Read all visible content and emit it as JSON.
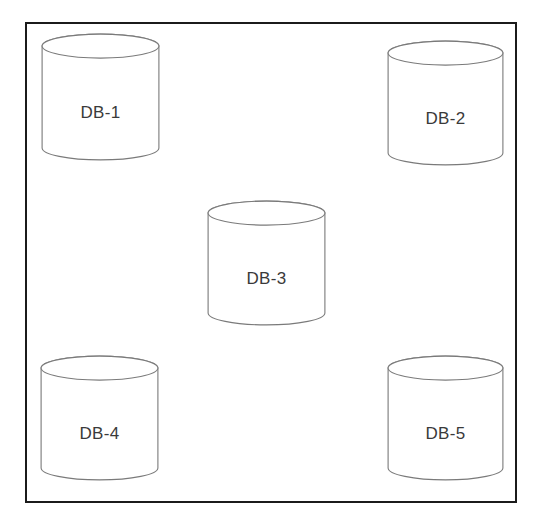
{
  "diagram": {
    "background_color": "#ffffff",
    "frame": {
      "name": "outer-boundary",
      "border_color": "#1b1b1b",
      "border_width": 2.5,
      "x": 25,
      "y": 22,
      "width": 492,
      "height": 481
    },
    "shape_style": {
      "type": "cylinder",
      "stroke_color": "#7a7a7a",
      "stroke_width": 1.1,
      "fill_color": "#ffffff",
      "label_color": "#3a3a3a",
      "label_font_size": 17
    },
    "nodes": [
      {
        "id": "db-1",
        "label": "DB-1",
        "position": "top-left",
        "x": 41,
        "y": 33,
        "width": 119,
        "height": 128,
        "ellipse_ry": 12,
        "label_offset": 70
      },
      {
        "id": "db-2",
        "label": "DB-2",
        "position": "top-right",
        "x": 387,
        "y": 40,
        "width": 117,
        "height": 126,
        "ellipse_ry": 12,
        "label_offset": 69
      },
      {
        "id": "db-3",
        "label": "DB-3",
        "position": "center",
        "x": 207,
        "y": 200,
        "width": 119,
        "height": 126,
        "ellipse_ry": 12,
        "label_offset": 69
      },
      {
        "id": "db-4",
        "label": "DB-4",
        "position": "bottom-left",
        "x": 40,
        "y": 355,
        "width": 119,
        "height": 126,
        "ellipse_ry": 12,
        "label_offset": 69
      },
      {
        "id": "db-5",
        "label": "DB-5",
        "position": "bottom-right",
        "x": 387,
        "y": 355,
        "width": 117,
        "height": 126,
        "ellipse_ry": 12,
        "label_offset": 69
      }
    ]
  }
}
